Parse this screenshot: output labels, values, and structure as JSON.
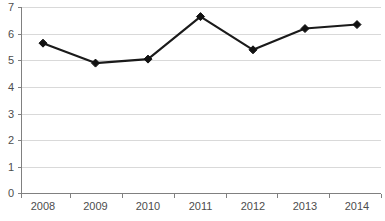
{
  "chart_data": {
    "type": "line",
    "title": "",
    "xlabel": "",
    "ylabel": "",
    "categories": [
      "2008",
      "2009",
      "2010",
      "2011",
      "2012",
      "2013",
      "2014"
    ],
    "values": [
      5.65,
      4.9,
      5.05,
      6.65,
      5.4,
      6.2,
      6.35
    ],
    "series": [
      {
        "name": "",
        "values": [
          5.65,
          4.9,
          5.05,
          6.65,
          5.4,
          6.2,
          6.35
        ]
      }
    ],
    "ylim": [
      0,
      7
    ],
    "xlim": [
      0,
      7
    ],
    "y_ticks": [
      "0",
      "1",
      "2",
      "3",
      "4",
      "5",
      "6",
      "7"
    ],
    "y_tick_values": [
      0,
      1,
      2,
      3,
      4,
      5,
      6,
      7
    ],
    "x_ticks": [
      "2008",
      "2009",
      "2010",
      "2011",
      "2012",
      "2013",
      "2014"
    ],
    "grid": "horizontal",
    "legend": "none",
    "marker": "diamond",
    "colors": {
      "line": "#1a1a1a",
      "marker": "#111111",
      "gridline": "#d9d9d9",
      "axis": "#808080",
      "tick_text": "#4d4d4d",
      "background": "#ffffff"
    }
  },
  "plot_geometry": {
    "left": 21,
    "right": 381,
    "top": 7.3,
    "bottom": 193.3,
    "x_positions": [
      43,
      95.5,
      148,
      200.5,
      253,
      305,
      357
    ],
    "x_boundaries": [
      20.7,
      70,
      122,
      173.5,
      225.5,
      277,
      329,
      381
    ]
  }
}
